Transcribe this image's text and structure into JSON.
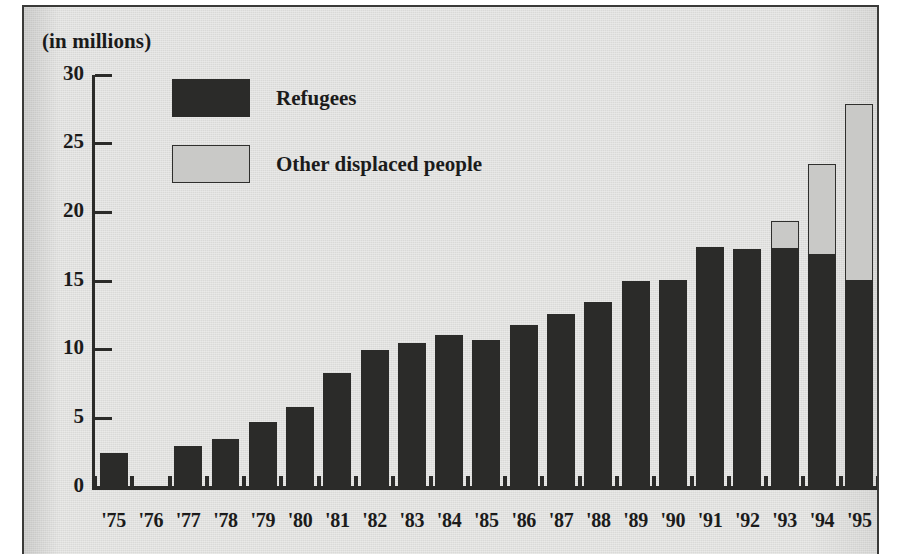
{
  "chart_data": {
    "type": "bar",
    "stacked": true,
    "title": "",
    "subtitle": "",
    "axis_note": "(in millions)",
    "xlabel": "",
    "ylabel": "",
    "ylim": [
      0,
      30
    ],
    "yticks": [
      0,
      5,
      10,
      15,
      20,
      25,
      30
    ],
    "ytick_labels": [
      "0",
      "5",
      "10",
      "15",
      "20",
      "25",
      "30"
    ],
    "grid": false,
    "legend_position": "top-left-inside",
    "categories": [
      "'75",
      "'76",
      "'77",
      "'78",
      "'79",
      "'80",
      "'81",
      "'82",
      "'83",
      "'84",
      "'85",
      "'86",
      "'87",
      "'88",
      "'89",
      "'90",
      "'91",
      "'92",
      "'93",
      "'94",
      "'95"
    ],
    "series": [
      {
        "name": "Refugees",
        "color": "#2b2b29",
        "values": [
          2.5,
          0,
          3.0,
          3.5,
          4.7,
          5.8,
          8.3,
          10.0,
          10.5,
          11.1,
          10.7,
          11.8,
          12.6,
          13.5,
          15.0,
          15.1,
          17.5,
          17.3,
          17.4,
          17.0,
          15.1
        ]
      },
      {
        "name": "Other displaced people",
        "color": "#c9c9c7",
        "values": [
          0,
          0,
          0,
          0,
          0,
          0,
          0,
          0,
          0,
          0,
          0,
          0,
          0,
          0,
          0,
          0,
          0,
          0,
          2.0,
          6.5,
          12.8
        ]
      }
    ],
    "totals": [
      2.5,
      0,
      3.0,
      3.5,
      4.7,
      5.8,
      8.3,
      10.0,
      10.5,
      11.1,
      10.7,
      11.8,
      12.6,
      13.5,
      15.0,
      15.1,
      17.5,
      17.3,
      19.4,
      23.5,
      27.9
    ]
  },
  "legend": {
    "items": [
      {
        "label": "Refugees",
        "swatch": "dark"
      },
      {
        "label": "Other displaced people",
        "swatch": "light"
      }
    ]
  },
  "colors": {
    "refugees": "#2b2b29",
    "other_displaced": "#c9c9c7",
    "axis": "#2b2b29",
    "text": "#1b1b1b",
    "panel_background": "#e2e2e0",
    "page_background": "#ffffff"
  }
}
